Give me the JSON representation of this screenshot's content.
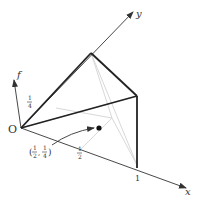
{
  "diagram": {
    "axes": {
      "x_label": "x",
      "y_label": "y",
      "f_label": "f",
      "origin_label": "O"
    },
    "ticks": {
      "x_one": "1",
      "x_half_num": "1",
      "x_half_den": "2",
      "f_quarter_num": "1",
      "f_quarter_den": "4"
    },
    "point": {
      "label_open": "(",
      "label_x_num": "1",
      "label_x_den": "2",
      "label_sep": ",",
      "label_y_num": "1",
      "label_y_den": "4",
      "label_close": ")"
    },
    "colors": {
      "axis": "#333333",
      "edge": "#222222",
      "hidden": "#d8d8d8"
    }
  }
}
